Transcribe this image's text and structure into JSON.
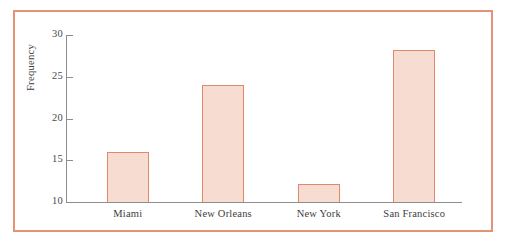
{
  "chart_data": {
    "type": "bar",
    "title": "",
    "xlabel": "",
    "ylabel": "Frequency",
    "categories": [
      "Miami",
      "New Orleans",
      "New York",
      "San Francisco"
    ],
    "values": [
      16,
      24,
      12.2,
      28.2
    ],
    "ylim": [
      10,
      30
    ],
    "yticks": [
      10,
      15,
      20,
      25,
      30
    ],
    "ytick_labels": [
      "10",
      "15",
      "20",
      "25",
      "30"
    ],
    "grid": false,
    "legend": null,
    "colors": {
      "bar_fill": "#f7dcd1",
      "bar_border": "#e1886a",
      "frame_border": "#e59377",
      "axis_line": "#8d8d8d",
      "text": "#3d3d3d"
    }
  },
  "axis": {
    "y_title": "Frequency",
    "ticks": [
      {
        "label": "30"
      },
      {
        "label": "25"
      },
      {
        "label": "20"
      },
      {
        "label": "15"
      },
      {
        "label": "10"
      }
    ]
  },
  "bars": [
    {
      "label": "Miami",
      "value": "16"
    },
    {
      "label": "New Orleans",
      "value": "24"
    },
    {
      "label": "New York",
      "value": "12.2"
    },
    {
      "label": "San Francisco",
      "value": "28.2"
    }
  ]
}
